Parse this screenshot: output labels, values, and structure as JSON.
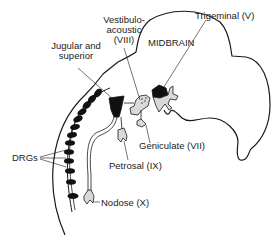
{
  "diagram": {
    "type": "anatomical-schematic",
    "region_label": "MIDBRAIN",
    "labels": {
      "vestibulo_acoustic_line1": "Vestibulo-",
      "vestibulo_acoustic_line2": "acoustic",
      "vestibulo_acoustic_line3": "(VIII)",
      "jugular_line1": "Jugular and",
      "jugular_line2": "superior",
      "trigeminal": "Trigeminal (V)",
      "midbrain": "MIDBRAIN",
      "geniculate": "Geniculate (VII)",
      "petrosal": "Petrosal (IX)",
      "nodose": "Nodose (X)",
      "drgs": "DRGs"
    },
    "colors": {
      "outline": "#1a1a1a",
      "ganglion_fill_dark": "#111111",
      "ganglion_fill_light": "#d9d9d9",
      "background": "#ffffff"
    },
    "drg_count": 13
  }
}
